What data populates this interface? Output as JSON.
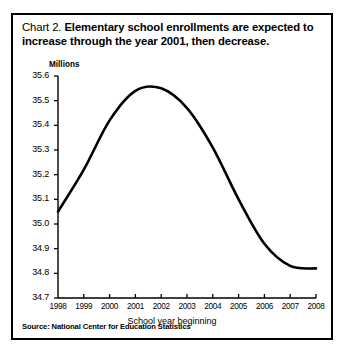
{
  "title": {
    "lead": "Chart 2.",
    "text": "Elementary school enrollments are expected to increase through the year 2001, then decrease."
  },
  "source": "Source: National Center for Education Statistics",
  "chart_data": {
    "type": "line",
    "title": "Chart 2.  Elementary school enrollments are expected to increase through the year 2001, then decrease.",
    "xlabel": "School year beginning",
    "ylabel": "Millions",
    "unit_label": "Millions",
    "grid": false,
    "legend": null,
    "xlim": [
      1998,
      2008
    ],
    "ylim": [
      34.7,
      35.6
    ],
    "x": [
      1998,
      1999,
      2000,
      2001,
      2002,
      2003,
      2004,
      2005,
      2006,
      2007,
      2008
    ],
    "xtick_labels": [
      "1998",
      "1999",
      "2000",
      "2001",
      "2002",
      "2003",
      "2004",
      "2005",
      "2006",
      "2007",
      "2008"
    ],
    "ytick_labels": [
      "35.6",
      "35.5",
      "35.4",
      "35.3",
      "35.2",
      "35.1",
      "35.0",
      "34.9",
      "34.8",
      "34.7"
    ],
    "ytick_values": [
      35.6,
      35.5,
      35.4,
      35.3,
      35.2,
      35.1,
      35.0,
      34.9,
      34.8,
      34.7
    ],
    "values": [
      35.05,
      35.22,
      35.42,
      35.54,
      35.55,
      35.47,
      35.31,
      35.1,
      34.92,
      34.83,
      34.82
    ],
    "series": [
      {
        "name": "Elementary school enrollments",
        "values": [
          35.05,
          35.22,
          35.42,
          35.54,
          35.55,
          35.47,
          35.31,
          35.1,
          34.92,
          34.83,
          34.82
        ]
      }
    ],
    "line_color": "#000000",
    "line_width": 2.6
  }
}
